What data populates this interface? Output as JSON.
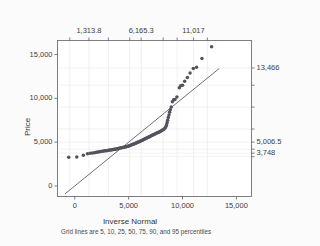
{
  "chart_data": {
    "type": "scatter",
    "title": "",
    "xlabel": "Inverse Normal",
    "ylabel": "Price",
    "xlim": [
      -1600,
      16400
    ],
    "ylim": [
      -1200,
      16600
    ],
    "xticks": [
      "0",
      "5,000",
      "10,000",
      "15,000"
    ],
    "xtick_values": [
      0,
      5000,
      10000,
      15000
    ],
    "yticks": [
      "0",
      "5,000",
      "10,000",
      "15,000"
    ],
    "ytick_values": [
      0,
      5000,
      10000,
      15000
    ],
    "top_axis": {
      "label": "",
      "ticks": [
        "1,313.8",
        "6,165.3",
        "11,017"
      ],
      "tick_values": [
        1313.8,
        6165.3,
        11017
      ],
      "gridline_values": [
        -460,
        1313.8,
        3117,
        5100,
        6165.3,
        8200,
        9500,
        11017,
        12300
      ],
      "percentiles": [
        5,
        10,
        25,
        50,
        75,
        90,
        95
      ]
    },
    "right_axis": {
      "label": "",
      "ticks": [
        "13,466",
        "5,006.5",
        "3,748"
      ],
      "tick_values": [
        13466,
        5006.5,
        3748
      ],
      "gridline_values": [
        3340,
        3748,
        4200,
        5006.5,
        6500,
        9000,
        11500,
        13466
      ]
    },
    "caption": "Grid lines are 5, 10, 25, 50, 75, 90, and 95 percentiles",
    "grid": true,
    "legend": "none",
    "reference_line": {
      "name": "45-degree reference line",
      "x": [
        -900,
        13400
      ],
      "y": [
        -900,
        13400
      ],
      "color": "#4a4a52"
    },
    "series": [
      {
        "name": "Price quantiles",
        "marker": "circle",
        "color": "#53535c",
        "points": [
          [
            -560,
            3291
          ],
          [
            190,
            3310
          ],
          [
            800,
            3520
          ],
          [
            1180,
            3670
          ],
          [
            1430,
            3730
          ],
          [
            1640,
            3750
          ],
          [
            1830,
            3800
          ],
          [
            2000,
            3860
          ],
          [
            2150,
            3885
          ],
          [
            2290,
            3900
          ],
          [
            2430,
            3940
          ],
          [
            2560,
            3960
          ],
          [
            2690,
            3985
          ],
          [
            2810,
            4010
          ],
          [
            2930,
            4030
          ],
          [
            3040,
            4050
          ],
          [
            3150,
            4075
          ],
          [
            3260,
            4100
          ],
          [
            3370,
            4120
          ],
          [
            3470,
            4140
          ],
          [
            3570,
            4170
          ],
          [
            3670,
            4190
          ],
          [
            3770,
            4200
          ],
          [
            3860,
            4220
          ],
          [
            3950,
            4250
          ],
          [
            4050,
            4290
          ],
          [
            4140,
            4310
          ],
          [
            4230,
            4330
          ],
          [
            4320,
            4350
          ],
          [
            4400,
            4380
          ],
          [
            4490,
            4400
          ],
          [
            4580,
            4420
          ],
          [
            4660,
            4450
          ],
          [
            4750,
            4480
          ],
          [
            4830,
            4500
          ],
          [
            4920,
            4530
          ],
          [
            5000,
            4560
          ],
          [
            5080,
            4600
          ],
          [
            5170,
            4640
          ],
          [
            5250,
            4680
          ],
          [
            5330,
            4720
          ],
          [
            5410,
            4760
          ],
          [
            5500,
            4800
          ],
          [
            5580,
            4850
          ],
          [
            5660,
            4890
          ],
          [
            5740,
            4930
          ],
          [
            5820,
            4980
          ],
          [
            5900,
            5010
          ],
          [
            5980,
            5060
          ],
          [
            6070,
            5110
          ],
          [
            6150,
            5160
          ],
          [
            6230,
            5200
          ],
          [
            6310,
            5250
          ],
          [
            6390,
            5300
          ],
          [
            6470,
            5350
          ],
          [
            6560,
            5400
          ],
          [
            6640,
            5450
          ],
          [
            6720,
            5500
          ],
          [
            6800,
            5550
          ],
          [
            6890,
            5600
          ],
          [
            6970,
            5650
          ],
          [
            7050,
            5700
          ],
          [
            7140,
            5760
          ],
          [
            7220,
            5810
          ],
          [
            7310,
            5860
          ],
          [
            7390,
            5910
          ],
          [
            7480,
            5960
          ],
          [
            7570,
            6010
          ],
          [
            7650,
            6060
          ],
          [
            7740,
            6110
          ],
          [
            7830,
            6160
          ],
          [
            7920,
            6220
          ],
          [
            8010,
            6280
          ],
          [
            8100,
            6350
          ],
          [
            8200,
            6420
          ],
          [
            8290,
            6500
          ],
          [
            8390,
            6620
          ],
          [
            8460,
            6800
          ],
          [
            8520,
            7000
          ],
          [
            8570,
            7250
          ],
          [
            8620,
            7500
          ],
          [
            8680,
            7800
          ],
          [
            8740,
            8100
          ],
          [
            8800,
            8400
          ],
          [
            8870,
            8700
          ],
          [
            8950,
            9000
          ],
          [
            9060,
            9600
          ],
          [
            9180,
            9830
          ],
          [
            9300,
            9880
          ],
          [
            9480,
            10150
          ],
          [
            9700,
            11200
          ],
          [
            9830,
            11450
          ],
          [
            10000,
            11500
          ],
          [
            10200,
            11950
          ],
          [
            10450,
            12380
          ],
          [
            10700,
            12900
          ],
          [
            11000,
            13400
          ],
          [
            11300,
            13540
          ],
          [
            11800,
            14560
          ],
          [
            12700,
            15900
          ]
        ]
      }
    ]
  }
}
